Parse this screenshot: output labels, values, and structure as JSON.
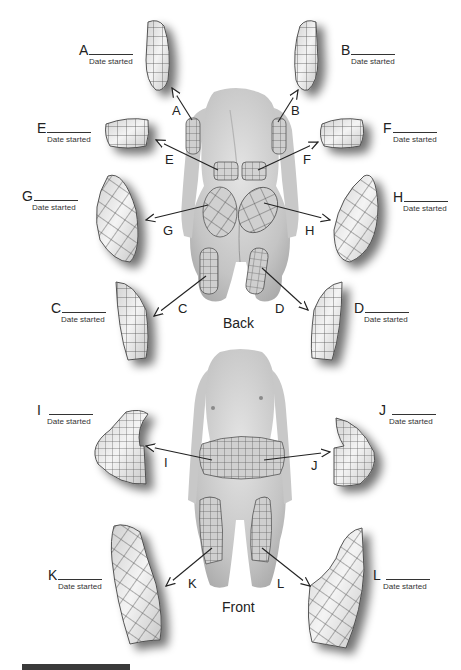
{
  "figure": {
    "views": {
      "back": "Back",
      "front": "Front"
    },
    "date_label": "Date started",
    "sites": [
      {
        "id": "A",
        "label": "A",
        "view": "back",
        "region": "left upper arm (back)"
      },
      {
        "id": "B",
        "label": "B",
        "view": "back",
        "region": "right upper arm (back)"
      },
      {
        "id": "C",
        "label": "C",
        "view": "back",
        "region": "left posterior thigh"
      },
      {
        "id": "D",
        "label": "D",
        "view": "back",
        "region": "right posterior thigh"
      },
      {
        "id": "E",
        "label": "E",
        "view": "back",
        "region": "left lower back"
      },
      {
        "id": "F",
        "label": "F",
        "view": "back",
        "region": "right lower back"
      },
      {
        "id": "G",
        "label": "G",
        "view": "back",
        "region": "left buttock"
      },
      {
        "id": "H",
        "label": "H",
        "view": "back",
        "region": "right buttock"
      },
      {
        "id": "I",
        "label": "I",
        "view": "front",
        "region": "abdomen left"
      },
      {
        "id": "J",
        "label": "J",
        "view": "front",
        "region": "abdomen right"
      },
      {
        "id": "K",
        "label": "K",
        "view": "front",
        "region": "left anterior thigh"
      },
      {
        "id": "L",
        "label": "L",
        "view": "front",
        "region": "right anterior thigh"
      }
    ]
  },
  "colors": {
    "skin": "#c9c9c9",
    "patch_fill": "#e6e6e6",
    "grid_line": "#555555",
    "text": "#222222",
    "footer_bar": "#3a3a3a"
  }
}
